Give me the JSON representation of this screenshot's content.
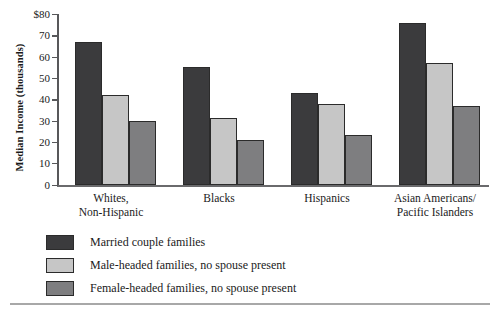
{
  "chart_data": {
    "type": "bar",
    "title": "",
    "xlabel": "",
    "ylabel": "Median Income (thousands)",
    "ylim": [
      0,
      80
    ],
    "yticks": [
      0,
      10,
      20,
      30,
      40,
      50,
      60,
      70,
      80
    ],
    "ytick_labels": [
      "0",
      "10",
      "20",
      "30",
      "40",
      "50",
      "60",
      "70",
      "$80"
    ],
    "grid": false,
    "legend_position": "below",
    "categories": [
      "Whites,\nNon-Hispanic",
      "Blacks",
      "Hispanics",
      "Asian Americans/\nPacific Islanders"
    ],
    "series": [
      {
        "name": "Married couple families",
        "color": "#3b3b3d",
        "values": [
          67,
          55,
          43,
          76
        ]
      },
      {
        "name": "Male-headed families, no spouse present",
        "color": "#c6c6c6",
        "values": [
          42,
          31,
          38,
          57
        ]
      },
      {
        "name": "Female-headed families, no spouse present",
        "color": "#7e7e80",
        "values": [
          30,
          21,
          23,
          37
        ]
      }
    ]
  },
  "legend": {
    "items": [
      {
        "label": "Married couple families",
        "swatch": "s0"
      },
      {
        "label": "Male-headed families, no spouse present",
        "swatch": "s1"
      },
      {
        "label": "Female-headed families, no spouse present",
        "swatch": "s2"
      }
    ]
  }
}
